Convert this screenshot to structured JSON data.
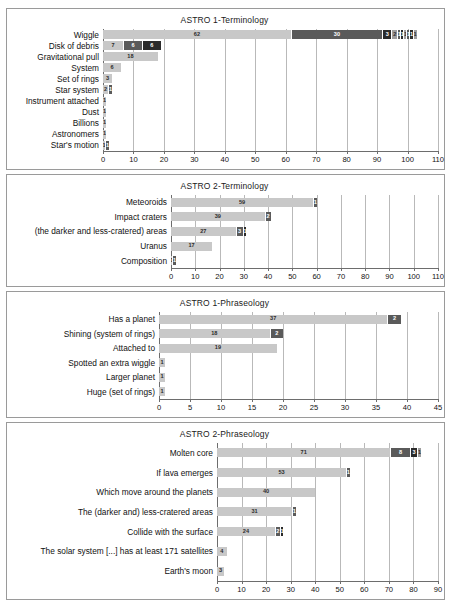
{
  "page": {
    "background": "#ffffff",
    "border_color": "#9a9a9a"
  },
  "palette": {
    "segment_light": "#c8c8c8",
    "segment_mid": "#9e9e9e",
    "segment_dark": "#5a5a5a",
    "segment_darkest": "#2b2b2b",
    "gridline": "#b9b9b9",
    "axis": "#6d6d6d",
    "value_light_text": "#2b2b2b",
    "value_dark_text": "#ffffff"
  },
  "chart_data": [
    {
      "type": "bar",
      "orientation": "horizontal",
      "title": "ASTRO 1-Terminology",
      "xlabel": "",
      "ylabel": "",
      "xlim": [
        0,
        110
      ],
      "xticks": [
        0,
        10,
        20,
        30,
        40,
        50,
        60,
        70,
        80,
        90,
        100,
        110
      ],
      "grid": true,
      "stacked": true,
      "label_width_px": 92,
      "categories": [
        "Wiggle",
        "Disk of debris",
        "Gravitational pull",
        "System",
        "Set of rings",
        "Star system",
        "Instrument attached",
        "Dust",
        "Billions",
        "Astronomers",
        "Star's motion"
      ],
      "stacks": [
        [
          62,
          30,
          3,
          2,
          1,
          1,
          1,
          1,
          1,
          1
        ],
        [
          7,
          6,
          6
        ],
        [
          18
        ],
        [
          6
        ],
        [
          3
        ],
        [
          2,
          1
        ],
        [
          1
        ],
        [
          1
        ],
        [
          1
        ],
        [
          1
        ],
        [
          1,
          1
        ]
      ],
      "totals": [
        103,
        19,
        18,
        6,
        3,
        3,
        1,
        1,
        1,
        1,
        2
      ]
    },
    {
      "type": "bar",
      "orientation": "horizontal",
      "title": "ASTRO 2-Terminology",
      "xlabel": "",
      "ylabel": "",
      "xlim": [
        0,
        110
      ],
      "xticks": [
        0,
        10,
        20,
        30,
        40,
        50,
        60,
        70,
        80,
        90,
        100,
        110
      ],
      "grid": true,
      "stacked": true,
      "label_width_px": 160,
      "categories": [
        "Meteoroids",
        "Impact craters",
        "(the darker and less-cratered) areas",
        "Uranus",
        "Composition"
      ],
      "stacks": [
        [
          59,
          1
        ],
        [
          39,
          2
        ],
        [
          27,
          3,
          1
        ],
        [
          17
        ],
        [
          1,
          1
        ]
      ],
      "totals": [
        60,
        41,
        31,
        17,
        2
      ]
    },
    {
      "type": "bar",
      "orientation": "horizontal",
      "title": "ASTRO 1-Phraseology",
      "xlabel": "",
      "ylabel": "",
      "xlim": [
        0,
        45
      ],
      "xticks": [
        0,
        5,
        10,
        15,
        20,
        25,
        30,
        35,
        40,
        45
      ],
      "grid": true,
      "stacked": true,
      "label_width_px": 148,
      "categories": [
        "Has a planet",
        "Shining (system of rings)",
        "Attached to",
        "Spotted an extra wiggle",
        "Larger planet",
        "Huge (set of rings)"
      ],
      "stacks": [
        [
          37,
          2
        ],
        [
          18,
          2
        ],
        [
          19
        ],
        [
          1
        ],
        [
          1
        ],
        [
          1
        ]
      ],
      "totals": [
        39,
        20,
        19,
        1,
        1,
        1
      ]
    },
    {
      "type": "bar",
      "orientation": "horizontal",
      "title": "ASTRO 2-Phraseology",
      "xlabel": "",
      "ylabel": "",
      "xlim": [
        0,
        90
      ],
      "xticks": [
        0,
        10,
        20,
        30,
        40,
        50,
        60,
        70,
        80,
        90
      ],
      "grid": true,
      "stacked": true,
      "label_width_px": 206,
      "categories": [
        "Molten core",
        "If lava emerges",
        "Which move around the planets",
        "The (darker and) less-cratered areas",
        "Collide with the surface",
        "The solar system [...] has at least 171 satellites",
        "Earth's moon"
      ],
      "stacks": [
        [
          71,
          8,
          3,
          1
        ],
        [
          53,
          1
        ],
        [
          40
        ],
        [
          31,
          1
        ],
        [
          24,
          2,
          1
        ],
        [
          4
        ],
        [
          3
        ]
      ],
      "totals": [
        83,
        54,
        40,
        32,
        27,
        4,
        3
      ]
    }
  ]
}
